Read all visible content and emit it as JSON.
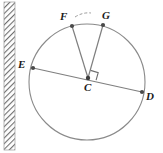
{
  "figure": {
    "type": "circle-geometry-diagram",
    "width": 163,
    "height": 153,
    "background": "#ffffff",
    "stroke_color": "#8a8a8a",
    "label_color": "#1a1a1a",
    "hatch_color": "#7d7d7d"
  },
  "circle": {
    "center_label": "C",
    "center": {
      "x": 87,
      "y": 82
    },
    "radius": 58,
    "stroke": "#8a8a8a",
    "stroke_width": 1
  },
  "points": [
    {
      "label": "F",
      "x": 72,
      "y": 26,
      "label_x": 60,
      "label_y": 11
    },
    {
      "label": "G",
      "x": 103,
      "y": 25,
      "label_x": 103,
      "label_y": 10
    },
    {
      "label": "E",
      "x": 33,
      "y": 68,
      "label_x": 18,
      "label_y": 59
    },
    {
      "label": "C",
      "x": 88,
      "y": 78,
      "label_x": 83,
      "label_y": 82
    },
    {
      "label": "D",
      "x": 142,
      "y": 92,
      "label_x": 146,
      "label_y": 91
    }
  ],
  "segments": [
    {
      "name": "diameter-ED",
      "from": "E",
      "to": "D"
    },
    {
      "name": "radius-CF",
      "from": "C",
      "to": "F"
    },
    {
      "name": "radius-CG",
      "from": "C",
      "to": "G"
    }
  ],
  "markings": {
    "right_angle": {
      "name": "right-angle-mark-at-C",
      "vertex": {
        "x": 88,
        "y": 78
      },
      "size": 8
    },
    "arc_mark": {
      "name": "arc-mark-FG",
      "from": {
        "x": 76,
        "y": 16
      },
      "to": {
        "x": 90,
        "y": 13
      }
    }
  },
  "hatched_bar": {
    "name": "hatched-wall-bar",
    "x": 4,
    "y": 2,
    "width": 11,
    "height": 148,
    "pattern": "diagonal-hatch"
  }
}
